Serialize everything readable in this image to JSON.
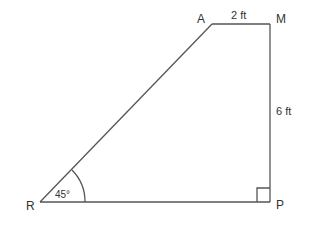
{
  "diagram": {
    "vertices": [
      {
        "name": "A",
        "x": 212,
        "y": 24
      },
      {
        "name": "M",
        "x": 270,
        "y": 24
      },
      {
        "name": "P",
        "x": 271,
        "y": 202
      },
      {
        "name": "R",
        "x": 40,
        "y": 202
      }
    ],
    "labels": {
      "A": "A",
      "M": "M",
      "P": "P",
      "R": "R",
      "top_length": "2 ft",
      "right_length": "6 ft",
      "angle_R": "45°"
    },
    "right_angle_at": "P",
    "line_color": "#555555"
  }
}
